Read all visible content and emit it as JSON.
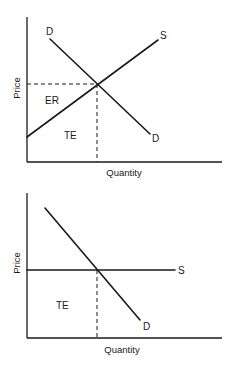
{
  "diagrams": [
    {
      "id": "top",
      "description": "Upward sloping supply curve with downward sloping demand curve",
      "y_axis_label": "Price",
      "x_axis_label": "Quantity",
      "curves": {
        "demand": {
          "label_start": "D",
          "label_end": "D"
        },
        "supply": {
          "label": "S"
        }
      },
      "regions": {
        "upper": "ER",
        "lower": "TE"
      }
    },
    {
      "id": "bottom",
      "description": "Perfectly elastic (horizontal) supply curve with downward sloping demand curve",
      "y_axis_label": "Price",
      "x_axis_label": "Quantity",
      "curves": {
        "demand": {
          "label": "D"
        },
        "supply": {
          "label": "S"
        }
      },
      "regions": {
        "lower": "TE"
      }
    }
  ],
  "colors": {
    "ink": "#1a1a1a",
    "background": "#ffffff"
  }
}
